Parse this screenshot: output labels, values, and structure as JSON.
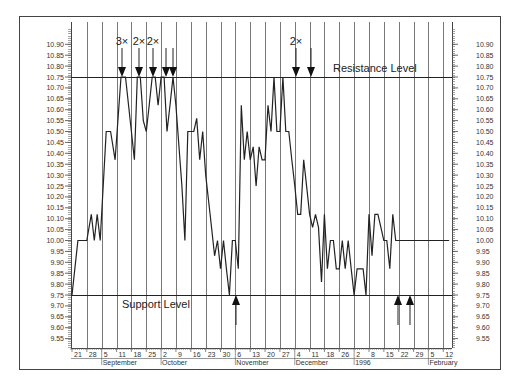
{
  "chart_data": {
    "type": "line",
    "title": "",
    "xlabel": "",
    "ylabel": "",
    "ylim": [
      9.5,
      10.95
    ],
    "grid": {
      "vertical": true,
      "horizontal": false
    },
    "y_ticks": [
      "10.90",
      "10.85",
      "10.80",
      "10.75",
      "10.70",
      "10.65",
      "10.60",
      "10.55",
      "10.50",
      "10.45",
      "10.40",
      "10.35",
      "10.30",
      "10.25",
      "10.20",
      "10.15",
      "10.10",
      "10.05",
      "10.00",
      "9.95",
      "9.90",
      "9.85",
      "9.80",
      "9.75",
      "9.70",
      "9.65",
      "9.60",
      "9.55"
    ],
    "x_tick_labels": [
      "21",
      "28",
      "5",
      "11",
      "18",
      "25",
      "2",
      "9",
      "16",
      "23",
      "30",
      "6",
      "13",
      "20",
      "27",
      "4",
      "11",
      "18",
      "26",
      "2",
      "8",
      "15",
      "22",
      "29",
      "5",
      "12"
    ],
    "month_labels": [
      {
        "label": "September",
        "tick_index": 2
      },
      {
        "label": "October",
        "tick_index": 6
      },
      {
        "label": "November",
        "tick_index": 11
      },
      {
        "label": "December",
        "tick_index": 15
      },
      {
        "label": "1996",
        "tick_index": 19
      },
      {
        "label": "February",
        "tick_index": 24
      }
    ],
    "series": [
      {
        "name": "Price",
        "x": [
          0,
          0.4,
          1.0,
          1.3,
          1.5,
          1.7,
          1.9,
          2.1,
          2.3,
          2.6,
          2.9,
          3.3,
          3.6,
          4.0,
          4.2,
          4.4,
          4.6,
          4.8,
          5.0,
          5.2,
          5.4,
          5.6,
          5.8,
          6.0,
          6.2,
          6.4,
          6.6,
          6.8,
          7.0,
          7.4,
          7.6,
          7.8,
          8.0,
          8.2,
          8.4,
          8.6,
          8.8,
          9.0,
          9.3,
          9.6,
          9.8,
          10.0,
          10.2,
          10.4,
          10.6,
          10.8,
          11.0,
          11.2,
          11.4,
          11.6,
          11.8,
          12.0,
          12.2,
          12.4,
          12.6,
          12.8,
          13.0,
          13.2,
          13.4,
          13.6,
          13.8,
          14.0,
          14.2,
          14.4,
          14.6,
          14.8,
          15.0,
          15.2,
          15.4,
          15.6,
          15.8,
          16.0,
          16.2,
          16.4,
          16.6,
          16.8,
          17.0,
          17.2,
          17.4,
          17.6,
          17.8,
          18.0,
          18.2,
          18.4,
          18.6,
          18.8,
          19.0,
          19.2,
          19.4,
          19.6,
          19.8,
          20.0,
          20.2,
          20.4,
          20.6,
          20.8,
          21.0,
          21.2,
          21.4,
          21.6,
          21.8,
          22.0,
          22.2,
          22.4,
          22.6,
          22.8,
          23.0,
          23.2,
          23.4,
          23.6,
          23.8,
          24.0,
          24.2,
          24.4,
          24.6,
          24.8,
          25.0,
          25.2,
          25.4
        ],
        "values": [
          9.75,
          10.0,
          10.0,
          10.12,
          10.0,
          10.12,
          10.0,
          10.25,
          10.5,
          10.5,
          10.37,
          10.75,
          10.75,
          10.5,
          10.37,
          10.75,
          10.75,
          10.55,
          10.5,
          10.62,
          10.75,
          10.75,
          10.62,
          10.75,
          10.75,
          10.5,
          10.62,
          10.75,
          10.62,
          10.25,
          10.0,
          10.5,
          10.5,
          10.5,
          10.56,
          10.37,
          10.5,
          10.3,
          10.12,
          9.93,
          10.0,
          9.87,
          10.0,
          9.87,
          9.75,
          10.0,
          10.0,
          9.87,
          10.62,
          10.37,
          10.5,
          10.37,
          10.43,
          10.25,
          10.43,
          10.37,
          10.37,
          10.62,
          10.5,
          10.75,
          10.5,
          10.5,
          10.75,
          10.5,
          10.5,
          10.37,
          10.25,
          10.12,
          10.12,
          10.37,
          10.25,
          10.12,
          10.06,
          10.12,
          10.06,
          9.81,
          10.12,
          9.87,
          10.0,
          10.0,
          9.87,
          9.87,
          10.0,
          9.87,
          10.0,
          9.87,
          9.75,
          9.87,
          9.87,
          9.87,
          9.75,
          10.12,
          9.93,
          10.12,
          10.12,
          10.06,
          10.0,
          10.0,
          9.87,
          10.12,
          10.0,
          10.0,
          10.0,
          10.0,
          10.0,
          10.0,
          10.0,
          10.0,
          10.0,
          10.0,
          10.0,
          10.0,
          10.0,
          10.0,
          10.0,
          10.0,
          10.0,
          10.0,
          10.0
        ]
      }
    ],
    "levels": [
      {
        "name": "Resistance Level",
        "value": 10.75
      },
      {
        "name": "Support Level",
        "value": 9.75
      }
    ],
    "annotations": [
      {
        "type": "down-arrow",
        "x_px": 122,
        "label": "3×"
      },
      {
        "type": "down-arrow",
        "x_px": 139,
        "label": "2×"
      },
      {
        "type": "down-arrow",
        "x_px": 153,
        "label": "2×"
      },
      {
        "type": "down-arrow",
        "x_px": 166,
        "label": ""
      },
      {
        "type": "down-arrow",
        "x_px": 173,
        "label": ""
      },
      {
        "type": "down-arrow",
        "x_px": 296,
        "label": "2×"
      },
      {
        "type": "down-arrow",
        "x_px": 311,
        "label": ""
      },
      {
        "type": "up-arrow",
        "x_px": 236,
        "label": ""
      },
      {
        "type": "up-arrow",
        "x_px": 398,
        "label": ""
      },
      {
        "type": "up-arrow",
        "x_px": 410,
        "label": ""
      }
    ]
  },
  "labels": {
    "resistance": "Resistance Level",
    "support": "Support Level"
  }
}
